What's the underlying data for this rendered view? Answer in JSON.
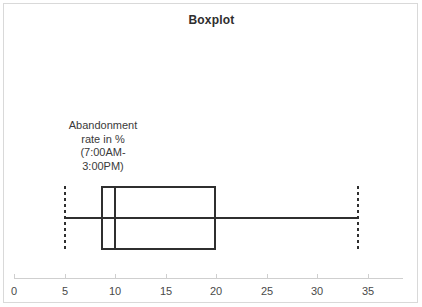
{
  "chart_data": {
    "type": "boxplot",
    "title": "Boxplot",
    "xlabel": "",
    "ylabel": "",
    "orientation": "horizontal",
    "grid": false,
    "legend": "none",
    "xlim": [
      0,
      38.5
    ],
    "xticks": [
      0,
      5,
      10,
      15,
      20,
      25,
      30,
      35
    ],
    "xtick_labels": [
      "0",
      "5",
      "10",
      "15",
      "20",
      "25",
      "30",
      "35"
    ],
    "series": [
      {
        "name": "Abandonment rate in % (7:00AM-3:00PM)",
        "label_lines": [
          "Abandonment",
          "rate in %",
          "(7:00AM-",
          "3:00PM)"
        ],
        "whisker_low": 5,
        "q1": 8.6,
        "median": 10,
        "q3": 20,
        "whisker_high": 34,
        "outliers": []
      }
    ],
    "colors": {
      "box_stroke": "#2f2f2f",
      "median": "#2f2f2f",
      "whisker": "#2f2f2f",
      "axis": "#cfcfcf",
      "frame": "#d9d9d9",
      "title_text": "#2e2e2e",
      "tick_text": "#4a4a4a",
      "label_text": "#3a3a3a",
      "background": "#ffffff"
    }
  }
}
